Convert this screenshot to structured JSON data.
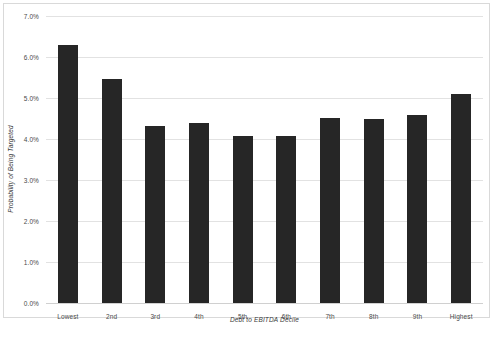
{
  "chart_data": {
    "type": "bar",
    "title": "",
    "subtitle": "",
    "xlabel": "Debt to EBITDA Decile",
    "ylabel": "Probability of Being Targeted",
    "categories": [
      "Lowest",
      "2nd",
      "3rd",
      "4th",
      "5th",
      "6th",
      "7th",
      "8th",
      "9th",
      "Highest"
    ],
    "values": [
      6.3,
      5.47,
      4.31,
      4.39,
      4.07,
      4.07,
      4.51,
      4.49,
      4.58,
      5.1
    ],
    "value_labels": [
      "6.3%",
      "5.47%",
      "4.31%",
      "4.39%",
      "4.07%",
      "4.07%",
      "4.51%",
      "4.49%",
      "4.58%",
      "5.1%"
    ],
    "ylim": [
      0,
      7
    ],
    "ytick_values": [
      7,
      6,
      5,
      4,
      3,
      2,
      1,
      0
    ],
    "ytick_labels": [
      "7.0%",
      "6.0%",
      "5.0%",
      "4.0%",
      "3.0%",
      "2.0%",
      "1.0%",
      "0.0%"
    ],
    "grid": true,
    "legend": false,
    "legend_position": "none",
    "series": [
      {
        "name": "Probability of Being Targeted",
        "color": "#262626",
        "values": [
          6.3,
          5.47,
          4.31,
          4.39,
          4.07,
          4.07,
          4.51,
          4.49,
          4.58,
          5.1
        ]
      }
    ]
  },
  "style": {
    "bar_color": "#262626",
    "gridline_color": "#e2e2e2",
    "axis_text_color": "#4a4a4a",
    "background_color": "#ffffff",
    "border_color": "#d9d9d9"
  }
}
